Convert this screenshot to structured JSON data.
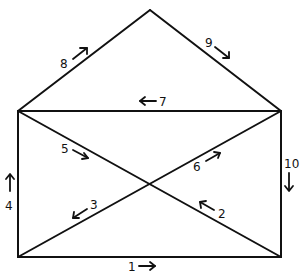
{
  "diagram": {
    "vertices": {
      "apex": [
        150,
        10
      ],
      "top_left": [
        18,
        111
      ],
      "top_right": [
        281,
        111
      ],
      "bottom_left": [
        18,
        257
      ],
      "bottom_right": [
        281,
        257
      ],
      "center": [
        150,
        184
      ]
    },
    "edges": [
      {
        "number": "1",
        "from": "bottom_left",
        "to": "bottom_right",
        "direction": "right"
      },
      {
        "number": "2",
        "from": "bottom_right",
        "to": "center",
        "direction": "up-left"
      },
      {
        "number": "3",
        "from": "center",
        "to": "bottom_left",
        "direction": "down-left"
      },
      {
        "number": "4",
        "from": "bottom_left",
        "to": "top_left",
        "direction": "up"
      },
      {
        "number": "5",
        "from": "top_left",
        "to": "center",
        "direction": "down-right"
      },
      {
        "number": "6",
        "from": "center",
        "to": "top_right",
        "direction": "up-right"
      },
      {
        "number": "7",
        "from": "top_right",
        "to": "top_left",
        "direction": "left"
      },
      {
        "number": "8",
        "from": "top_left",
        "to": "apex",
        "direction": "up-right"
      },
      {
        "number": "9",
        "from": "apex",
        "to": "top_right",
        "direction": "down-right"
      },
      {
        "number": "10",
        "from": "top_right",
        "to": "bottom_right",
        "direction": "down"
      }
    ],
    "labels": {
      "e1": "1",
      "e2": "2",
      "e3": "3",
      "e4": "4",
      "e5": "5",
      "e6": "6",
      "e7": "7",
      "e8": "8",
      "e9": "9",
      "e10": "10"
    },
    "colors": {
      "line": "#111111",
      "background": "#ffffff"
    }
  }
}
